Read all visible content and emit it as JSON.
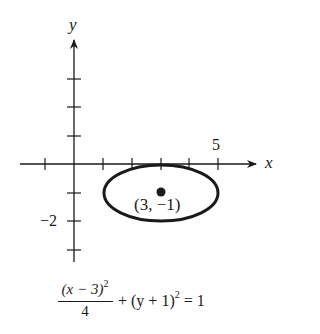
{
  "figure": {
    "type": "ellipse-graph",
    "axes": {
      "x_label": "x",
      "y_label": "y",
      "x_tick_label": "5",
      "y_tick_label": "−2",
      "x_ticks": [
        -1,
        1,
        2,
        3,
        4,
        5
      ],
      "y_ticks": [
        3,
        2,
        1,
        -1,
        -2,
        -3
      ]
    },
    "ellipse": {
      "center": [
        3,
        -1
      ],
      "semi_major_x": 2,
      "semi_minor_y": 1,
      "center_label": "(3, −1)"
    },
    "equation": {
      "numerator": "(x − 3)",
      "numerator_exp": "2",
      "denominator": "4",
      "rest_a": "+ (y + 1)",
      "rest_exp": "2",
      "rest_b": " = 1"
    }
  }
}
